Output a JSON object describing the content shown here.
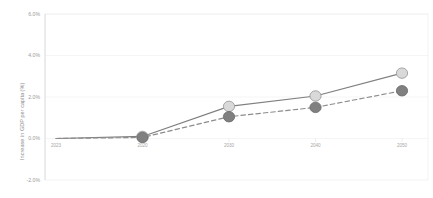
{
  "chart_data": {
    "type": "line",
    "title": "",
    "subtitle": "",
    "xlabel": "",
    "ylabel": "Increase in GDP per capita (%)",
    "x": [
      "2023",
      "2020",
      "2030",
      "2040",
      "2050"
    ],
    "xtick_labels": [
      "2023",
      "2020",
      "2030",
      "2040",
      "2050"
    ],
    "ytick_labels": [
      "6.0%",
      "4.0%",
      "2.0%",
      "0.0%",
      "-2.0%"
    ],
    "ytick_values": [
      6.0,
      4.0,
      2.0,
      0.0,
      -2.0
    ],
    "ylim": [
      -2.0,
      6.0
    ],
    "grid": "horizontal-faint",
    "legend": "none",
    "series": [
      {
        "name": "series-light-solid",
        "line_style": "solid",
        "color": "#7f7f7f",
        "marker_fill": "#d9d9d9",
        "marker_edge": "#9c9c9c",
        "x": [
          "2023",
          "2020",
          "2030",
          "2040",
          "2050"
        ],
        "values": [
          0.0,
          0.1,
          1.55,
          2.05,
          3.15
        ]
      },
      {
        "name": "series-dark-dashed",
        "line_style": "dashed",
        "color": "#8c8c8c",
        "marker_fill": "#808080",
        "marker_edge": "#6e6e6e",
        "x": [
          "2023",
          "2020",
          "2030",
          "2040",
          "2050"
        ],
        "values": [
          0.0,
          0.05,
          1.05,
          1.5,
          2.3
        ]
      }
    ],
    "annotations": []
  },
  "axes": {
    "y_axis_title": "Increase in GDP per capita (%)",
    "y_ticks": [
      {
        "label": "6.0%",
        "value": 6.0
      },
      {
        "label": "4.0%",
        "value": 4.0
      },
      {
        "label": "2.0%",
        "value": 2.0
      },
      {
        "label": "0.0%",
        "value": 0.0
      },
      {
        "label": "-2.0%",
        "value": -2.0
      }
    ],
    "x_ticks": [
      {
        "label": "2023"
      },
      {
        "label": "2020"
      },
      {
        "label": "2030"
      },
      {
        "label": "2040"
      },
      {
        "label": "2050"
      }
    ]
  },
  "colors": {
    "background": "#ffffff",
    "gridline": "#f0f0f0",
    "axis_line": "#dcdcdc",
    "tick_text": "#a5a5a5",
    "axis_title_text": "#8e8e8e",
    "light_marker_fill": "#d9d9d9",
    "light_marker_edge": "#9c9c9c",
    "dark_marker_fill": "#808080",
    "dark_marker_edge": "#6e6e6e",
    "solid_line": "#7f7f7f",
    "dashed_line": "#8c8c8c"
  }
}
